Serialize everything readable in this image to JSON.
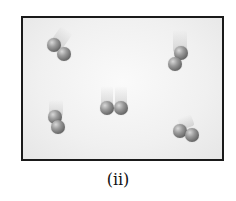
{
  "figure": {
    "label": "(ii)",
    "border_color": "#1a1a1a",
    "atom_color": "#7a7a7a"
  },
  "molecules": [
    {
      "id": 1,
      "position": "upper-left",
      "orientation": "diagonal"
    },
    {
      "id": 2,
      "position": "upper-right",
      "orientation": "vertical"
    },
    {
      "id": 3,
      "position": "center",
      "orientation": "horizontal"
    },
    {
      "id": 4,
      "position": "lower-left",
      "orientation": "vertical"
    },
    {
      "id": 5,
      "position": "lower-right",
      "orientation": "diagonal"
    }
  ]
}
